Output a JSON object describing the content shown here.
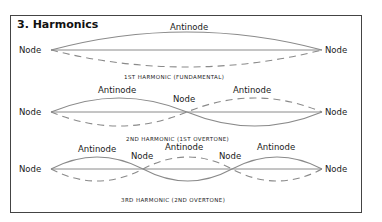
{
  "title": "3. Harmonics",
  "colors": {
    "wave": "#8a8a8a",
    "border": "#444444",
    "text": "#1a1a1a"
  },
  "harmonics": [
    {
      "caption": "1ST HARMONIC (FUNDAMENTAL)",
      "node_labels": [
        "Node",
        "Node"
      ],
      "antinode_labels": [
        "Antinode"
      ]
    },
    {
      "caption": "2ND HARMONIC (1ST OVERTONE)",
      "node_labels": [
        "Node",
        "Node",
        "Node"
      ],
      "antinode_labels": [
        "Antinode",
        "Antinode"
      ]
    },
    {
      "caption": "3RD HARMONIC (2ND OVERTONE)",
      "node_labels": [
        "Node",
        "Node",
        "Node",
        "Node"
      ],
      "antinode_labels": [
        "Antinode",
        "Antinode",
        "Antinode"
      ]
    }
  ]
}
